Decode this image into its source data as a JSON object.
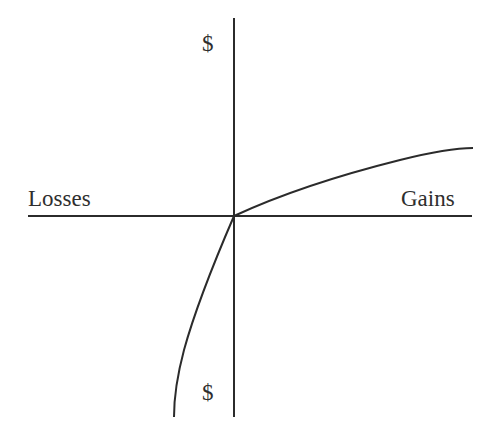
{
  "diagram": {
    "type": "value-function",
    "labels": {
      "x_negative": "Losses",
      "x_positive": "Gains",
      "y_positive": "$",
      "y_negative": "$"
    },
    "axes": {
      "origin": [
        234,
        216
      ],
      "x_axis": {
        "from": [
          28,
          216
        ],
        "to": [
          472,
          216
        ]
      },
      "y_axis": {
        "from": [
          234,
          18
        ],
        "to": [
          234,
          417
        ]
      }
    },
    "curves": [
      {
        "name": "gains-curve",
        "description": "Concave curve rising from origin into gains quadrant",
        "path": "M234,216 C290,190 360,170 400,160 C440,150 460,148 473,148"
      },
      {
        "name": "losses-curve",
        "description": "Convex, steeper curve descending from origin into losses quadrant",
        "path": "M234,216 C215,260 195,310 184,350 C176,380 174,400 174,417"
      }
    ],
    "colors": {
      "stroke": "#2b2b2b",
      "background": "#ffffff"
    }
  }
}
